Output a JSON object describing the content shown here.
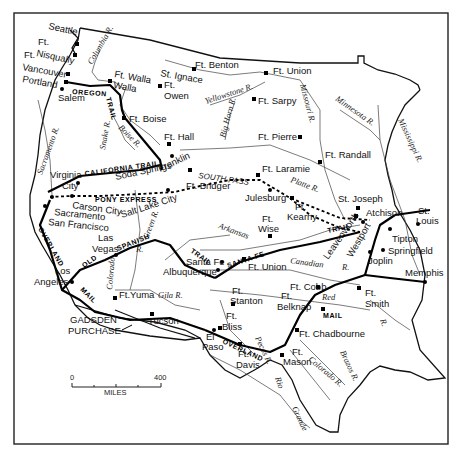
{
  "map": {
    "type": "historical-route-map",
    "region": "Western United States",
    "trails": [
      {
        "id": "oregon",
        "label": "OREGON TRAIL",
        "style": "solid"
      },
      {
        "id": "california",
        "label": "CALIFORNIA TRAIL",
        "style": "solid"
      },
      {
        "id": "pony",
        "label": "PONY EXPRESS",
        "style": "dashed"
      },
      {
        "id": "spanish",
        "label": "OLD SPANISH TRAIL",
        "style": "solid"
      },
      {
        "id": "santafe",
        "label": "SANTA FE TRAIL",
        "style": "solid"
      },
      {
        "id": "overland",
        "label": "OVERLAND MAIL",
        "style": "solid"
      }
    ],
    "trail_labels": {
      "oregon": "OREGON",
      "oregon_trail": "TRAIL",
      "california": "CALIFORNIA TRAIL",
      "pony": "PONY EXPRESS",
      "spanish_old": "OLD",
      "spanish": "SPANISH",
      "spanish_trail": "TRAIL",
      "santafe": "SANTA FE",
      "santafe_trail": "TRAIL",
      "overland_w": "OVERLAND",
      "mail_w": "MAIL",
      "overland_e": "OVERLAND",
      "mail_e": "MAIL"
    },
    "places": {
      "seattle": "Seattle",
      "ft_nisqually_1": "Ft.",
      "ft_nisqually_2": "Nisqually",
      "ft_vancouver_1": "Ft.",
      "ft_vancouver_2": "Vancouver",
      "portland": "Portland",
      "salem": "Salem",
      "ft_walla_1": "Ft. Walla",
      "ft_walla_2": "Walla",
      "st_ignace_1": "St. Ignace",
      "ft_owen_1": "Ft.",
      "ft_owen_2": "Owen",
      "ft_benton": "Ft. Benton",
      "ft_union_n": "Ft. Union",
      "ft_sarpy": "Ft. Sarpy",
      "ft_boise": "Ft. Boise",
      "ft_hall": "Ft. Hall",
      "ft_pierre": "Ft. Pierre",
      "ft_randall": "Ft. Randall",
      "virginia_city_1": "Virginia",
      "virginia_city_2": "City",
      "soda_springs": "Soda Springs",
      "franklin": "Franklin",
      "south_pass": "SOUTH PASS",
      "ft_bridger": "Ft. Bridger",
      "ft_laramie": "Ft. Laramie",
      "julesburg": "Julesburg",
      "carson_city": "Carson City",
      "sacramento": "Sacramento",
      "san_francisco": "San Francisco",
      "salt_lake_city": "Salt Lake City",
      "st_joseph": "St. Joseph",
      "ft_kearny_1": "Ft.",
      "ft_kearny_2": "Kearny",
      "atchison": "Atchison",
      "st_louis_1": "St.",
      "st_louis_2": "Louis",
      "leavenworth": "Leavenworth",
      "westport": "Westport",
      "tipton": "Tipton",
      "springfield": "Springfield",
      "joplin": "Joplin",
      "ft_wise_1": "Ft.",
      "ft_wise_2": "Wise",
      "las_vegas_1": "Las",
      "las_vegas_2": "Vegas",
      "los_angeles_1": "Los",
      "los_angeles_2": "Angeles",
      "santa_fe": "Santa Fe",
      "albuquerque": "Albuquerque",
      "ft_union_s": "Ft. Union",
      "memphis": "Memphis",
      "ft_yuma": "Ft.Yuma",
      "ft_stanton_1": "Ft.",
      "ft_stanton_2": "Stanton",
      "ft_cobb": "Ft. Cobb",
      "ft_smith_1": "Ft.",
      "ft_smith_2": "Smith",
      "ft_belknap_1": "Ft.",
      "ft_belknap_2": "Belknap",
      "tucson": "Tucson",
      "ft_bliss_1": "Ft.",
      "ft_bliss_2": "Bliss",
      "el_paso_1": "El",
      "el_paso_2": "Paso",
      "ft_chadbourne": "Ft. Chadbourne",
      "ft_davis_1": "Ft.",
      "ft_davis_2": "Davis",
      "ft_mason_1": "Ft.",
      "ft_mason_2": "Mason",
      "gadsden_1": "GADSDEN",
      "gadsden_2": "PURCHASE"
    },
    "rivers": {
      "columbia": "Columbia R.",
      "snake": "Snake R.",
      "boise": "Boise R.",
      "sacramento": "Sacramento R.",
      "yellowstone": "Yellowstone R.",
      "missouri": "Missouri R.",
      "big_horn": "Big Horn R.",
      "minnesota": "Minnesota R.",
      "mississippi": "Mississippi R.",
      "platte": "Platte R.",
      "green": "Green R.",
      "colorado_w": "Colorado",
      "colorado_r": "R.",
      "gila": "Gila R.",
      "arkansas": "Arkansas",
      "canadian": "Canadian",
      "canadian_r": "R.",
      "red": "Red",
      "red_r": "R.",
      "pecos": "Pecos R.",
      "brazos": "Brazos R.",
      "colorado_tx": "Colorado R.",
      "rio_grande_1": "Rio",
      "rio_grande_2": "Grande",
      "r_generic": "R."
    },
    "scale": {
      "min_label": "0",
      "max_label": "400",
      "unit": "MILES"
    }
  }
}
